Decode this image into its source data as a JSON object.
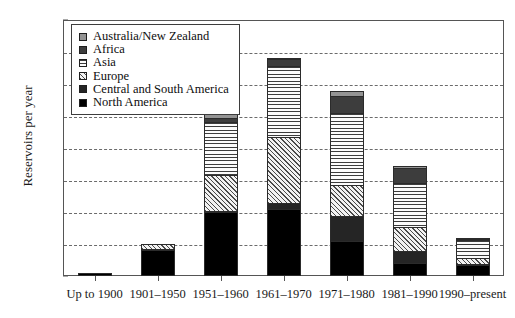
{
  "chart_data": {
    "type": "bar",
    "subtype": "stacked-vertical",
    "title": "",
    "xlabel": "",
    "ylabel": "Reservoirs per year",
    "ylim": [
      0,
      80
    ],
    "yticks": [
      0,
      10,
      20,
      30,
      40,
      50,
      60,
      70,
      80
    ],
    "grid": "horizontal-dashed",
    "legend_position": "top-left-inside",
    "categories": [
      "Up to 1900",
      "1901–1950",
      "1951–1960",
      "1961–1970",
      "1971–1980",
      "1981–1990",
      "1990–present"
    ],
    "series": [
      {
        "name": "North America",
        "key": "north",
        "color": "#000000",
        "pattern": "solid-black",
        "values": [
          0.8,
          8.0,
          20.0,
          21.0,
          11.0,
          4.0,
          3.5
        ]
      },
      {
        "name": "Central and South America",
        "key": "central",
        "color": "#252525",
        "pattern": "solid-dark",
        "values": [
          0.0,
          0.5,
          0.5,
          2.0,
          8.0,
          4.0,
          0.5
        ]
      },
      {
        "name": "Europe",
        "key": "europe",
        "color": "#f2f2f2",
        "pattern": "diagonal-hatch",
        "values": [
          0.0,
          2.0,
          11.5,
          21.0,
          10.0,
          8.0,
          2.0
        ]
      },
      {
        "name": "Asia",
        "key": "asia",
        "color": "#fbfbfb",
        "pattern": "horizontal-lines",
        "values": [
          0.0,
          0.0,
          17.0,
          22.5,
          23.0,
          14.0,
          6.0
        ]
      },
      {
        "name": "Africa",
        "key": "africa",
        "color": "#3d3d3d",
        "pattern": "solid-dark-gray",
        "values": [
          0.0,
          0.0,
          1.5,
          2.5,
          5.5,
          5.0,
          0.5
        ]
      },
      {
        "name": "Australia/New Zealand",
        "key": "aus",
        "color": "#949494",
        "pattern": "solid-gray",
        "values": [
          0.0,
          0.0,
          1.5,
          0.5,
          2.0,
          1.0,
          0.5
        ]
      }
    ],
    "totals": [
      0.8,
      10.5,
      52.0,
      69.5,
      59.5,
      36.0,
      13.0
    ]
  },
  "legend": {
    "items": [
      {
        "label": "Australia/New Zealand"
      },
      {
        "label": "Africa"
      },
      {
        "label": "Asia"
      },
      {
        "label": "Europe"
      },
      {
        "label": "Central and South America"
      },
      {
        "label": "North America"
      }
    ]
  },
  "axes": {
    "y_title": "Reservoirs per year"
  }
}
